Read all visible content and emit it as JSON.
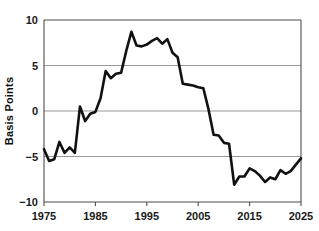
{
  "chart_data": {
    "type": "line",
    "title": "",
    "xlabel": "",
    "ylabel": "Basis Points",
    "xlim": [
      1975,
      2025
    ],
    "ylim": [
      -10,
      10
    ],
    "grid": true,
    "legend": "none",
    "y_ticks": [
      10,
      5,
      0,
      -5,
      -10
    ],
    "y_tick_labels": [
      "10",
      "5",
      "0",
      "−5",
      "−10"
    ],
    "x_ticks": [
      1975,
      1985,
      1995,
      2005,
      2015,
      2025
    ],
    "x_tick_labels": [
      "1975",
      "1985",
      "1995",
      "2005",
      "2015",
      "2025"
    ],
    "line_color": "#111111",
    "grid_color": "#8c8c8c",
    "axis_color": "#4d4d4d",
    "background_color": "#ffffff",
    "series": [
      {
        "name": "Basis Points",
        "x": [
          1975,
          1976,
          1977,
          1978,
          1979,
          1980,
          1981,
          1982,
          1983,
          1984,
          1985,
          1986,
          1987,
          1988,
          1989,
          1990,
          1991,
          1992,
          1993,
          1994,
          1995,
          1996,
          1997,
          1998,
          1999,
          2000,
          2001,
          2002,
          2003,
          2004,
          2005,
          2006,
          2007,
          2008,
          2009,
          2010,
          2011,
          2012,
          2013,
          2014,
          2015,
          2016,
          2017,
          2018,
          2019,
          2020,
          2021,
          2022,
          2023,
          2024,
          2025
        ],
        "values": [
          -4.2,
          -5.5,
          -5.3,
          -3.4,
          -4.6,
          -4.0,
          -4.6,
          0.5,
          -1.1,
          -0.3,
          -0.1,
          1.4,
          4.4,
          3.6,
          4.1,
          4.2,
          6.6,
          8.7,
          7.2,
          7.1,
          7.3,
          7.7,
          8.0,
          7.4,
          7.9,
          6.4,
          5.9,
          3.0,
          2.9,
          2.8,
          2.6,
          2.5,
          0.2,
          -2.6,
          -2.7,
          -3.5,
          -3.6,
          -8.1,
          -7.2,
          -7.2,
          -6.3,
          -6.6,
          -7.1,
          -7.8,
          -7.3,
          -7.5,
          -6.5,
          -6.9,
          -6.6,
          -5.9,
          -5.2
        ]
      }
    ]
  }
}
